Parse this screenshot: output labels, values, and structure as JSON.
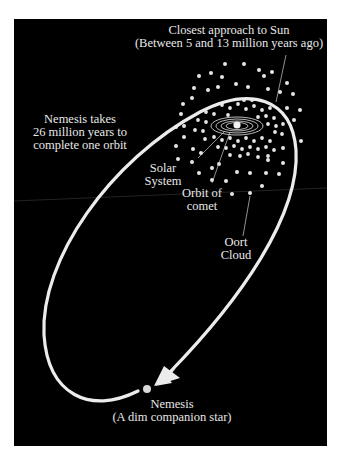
{
  "labels": {
    "closest_approach": {
      "line1": "Closest approach to Sun",
      "line2": "(Between 5 and 13 million years ago)"
    },
    "orbit_period": {
      "line1": "Nemesis takes",
      "line2": "26 million years to",
      "line3": "complete one orbit"
    },
    "solar_system": {
      "line1": "Solar",
      "line2": "System"
    },
    "comet_orbit": {
      "line1": "Orbit of",
      "line2": "comet"
    },
    "oort_cloud": {
      "line1": "Oort",
      "line2": "Cloud"
    },
    "nemesis": {
      "line1": "Nemesis",
      "line2": "(A dim companion star)"
    }
  },
  "colors": {
    "background": "#000000",
    "foreground": "#e8e8e8",
    "page": "#ffffff"
  }
}
